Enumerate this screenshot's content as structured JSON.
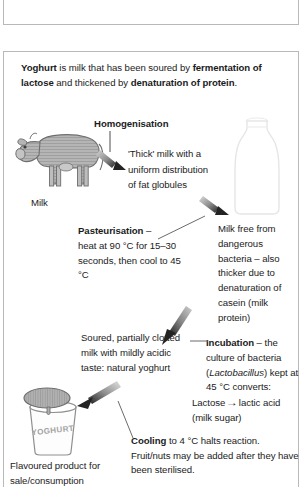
{
  "document": {
    "title": "Yoghurt production flow diagram",
    "top_panel_empty": true
  },
  "intro": {
    "lead": "Yoghurt",
    "part1": " is milk that has been soured by ",
    "bold1": "fermentation of lactose",
    "part2": " and thickened by ",
    "bold2": "denaturation of protein",
    "end": "."
  },
  "stages": {
    "homogenisation": {
      "label": "Homogenisation",
      "result": "'Thick' milk with a uniform distribution of fat globules"
    },
    "pasteurisation": {
      "label": "Pasteurisation",
      "dash": " –",
      "detail": "heat at 90 °C for 15–30 seconds, then cool to 45 °C",
      "result": "Milk free from dangerous bacteria – also thicker due to denaturation of casein (milk protein)"
    },
    "incubation": {
      "label": "Incubation",
      "detail_pre": " – the culture of bacteria (",
      "organism": "Lactobacillus",
      "detail_post": ") kept at 45 °C converts:",
      "reaction_left": "Lactose",
      "reaction_arrow": "→",
      "reaction_right": "lactic acid",
      "reaction_note": "(milk sugar)",
      "result": "Soured, partially clotted milk with mildly acidic taste: natural yoghurt"
    },
    "cooling": {
      "label": "Cooling",
      "detail": " to 4 °C halts reaction. Fruit/nuts may be added after they have been sterilised.",
      "result": "Flavoured product for sale/consumption"
    }
  },
  "figures": {
    "cow_caption": "Milk",
    "bottle_name": "milk-bottle-illustration",
    "pot_label": "YOGHURT",
    "pot_name": "yoghurt-pot-illustration"
  },
  "colors": {
    "text": "#1b1b1b",
    "border": "#b9b9b9",
    "arrow_dark": "#2a2a2a",
    "arrow_light": "#d8d8d8",
    "figure_grey": "#a9a9a9"
  }
}
